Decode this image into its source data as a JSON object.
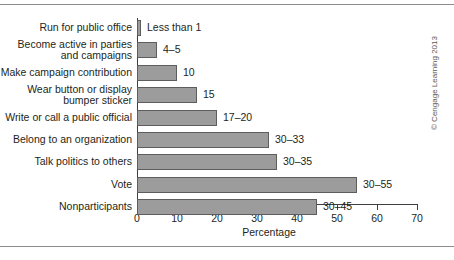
{
  "chart_data": {
    "type": "bar",
    "orientation": "horizontal",
    "title": "",
    "xlabel": "Percentage",
    "ylabel": "",
    "xlim": [
      0,
      70
    ],
    "xticks": [
      0,
      10,
      20,
      30,
      40,
      50,
      60,
      70
    ],
    "grid": false,
    "legend": null,
    "categories": [
      "Run for public office",
      "Become active in parties\nand campaigns",
      "Make campaign contribution",
      "Wear button or display\nbumper sticker",
      "Write or call a public official",
      "Belong to an organization",
      "Talk politics to others",
      "Vote",
      "Nonparticipants"
    ],
    "values": [
      1,
      5,
      10,
      15,
      20,
      33,
      35,
      55,
      45
    ],
    "value_labels": [
      "Less than 1",
      "4–5",
      "10",
      "15",
      "17–20",
      "30–33",
      "30–35",
      "30–55",
      "30–45"
    ],
    "bar_color": "#9c9c9c",
    "bar_border_color": "#5d5d5d",
    "axis_color": "#3f3f3f"
  },
  "credit": "© Cengage Learning 2013"
}
